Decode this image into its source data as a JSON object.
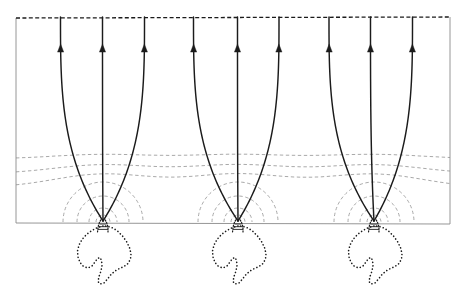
{
  "figure": {
    "type": "field-line-convergence-diagram",
    "title": "",
    "background_color": "#ffffff",
    "canvas": {
      "width": 464,
      "height": 297
    }
  },
  "domain_box": {
    "name": "simulation-domain",
    "x": 16,
    "y": 17,
    "width": 434,
    "height": 205,
    "left_edge_style": "solid",
    "right_edge_style": "solid",
    "bottom_edge_style": "solid",
    "top_edge_style": "dashed",
    "edge_color": "#8a8a8a",
    "top_edge_color": "#1b1b1b",
    "edge_width": 0.9,
    "top_edge_width": 1.3,
    "top_edge_dash": "4,2.4"
  },
  "field_lines": {
    "name": "magnetic-field-lines",
    "color": "#1b1b1b",
    "width": 1.45,
    "top_y": 17,
    "arrow": {
      "name": "flow-direction-arrowhead",
      "direction": "up",
      "y": 48,
      "half_width": 3.1,
      "length": 8.2,
      "color": "#1b1b1b"
    },
    "groups": [
      {
        "id": "group-1",
        "footpoint_x": 103,
        "footpoint_y": 221,
        "top_xs": [
          60.5,
          102.5,
          144.5
        ]
      },
      {
        "id": "group-2",
        "footpoint_x": 238,
        "footpoint_y": 221,
        "top_xs": [
          193.5,
          237.5,
          279.0
        ]
      },
      {
        "id": "group-3",
        "footpoint_x": 374,
        "footpoint_y": 221,
        "top_xs": [
          329.0,
          370.5,
          412.5
        ]
      }
    ],
    "shape_note": "near-vertical at top, flaring into a parabolic funnel that converges to the footpoint"
  },
  "contours": {
    "name": "equipotential-contours",
    "color": "#9a9a9a",
    "width": 0.85,
    "dash": "3.4,2.6",
    "levels": [
      {
        "id": "contour-1",
        "base_y": 157,
        "amplitude": 4.5,
        "kind": "wavy"
      },
      {
        "id": "contour-2",
        "base_y": 170,
        "amplitude": 9.0,
        "kind": "wavy"
      },
      {
        "id": "contour-3",
        "base_y": 182,
        "amplitude": 13.5,
        "kind": "wavy"
      }
    ],
    "arcs": [
      {
        "id": "arc-outer",
        "radius": 40
      },
      {
        "id": "arc-mid",
        "radius": 26
      },
      {
        "id": "arc-inner",
        "radius": 14
      },
      {
        "id": "arc-core",
        "radius": 7
      }
    ],
    "arc_note": "semicircular dashed arcs centered on each footpoint, open downward-clipped at the domain floor"
  },
  "blobs": {
    "name": "flux-rope-cross-sections",
    "color": "#1b1b1b",
    "width": 1.6,
    "dash": "0.1,3.3",
    "linecap": "round",
    "count": 3,
    "centers_x": [
      103,
      238,
      374
    ],
    "attach_y": 222,
    "neck": {
      "name": "neck-connector",
      "width": 11,
      "height": 10,
      "style": "dotted-converging-throat"
    },
    "outline_note": "irregular dotted closed curve, leaf/flame-like with a notch on the lower-left, hanging below the domain floor"
  },
  "legend": {
    "visible": false,
    "entries": []
  },
  "axes": {
    "visible": false,
    "tick_labels": [],
    "xlabel": "",
    "ylabel": ""
  },
  "annotations": []
}
